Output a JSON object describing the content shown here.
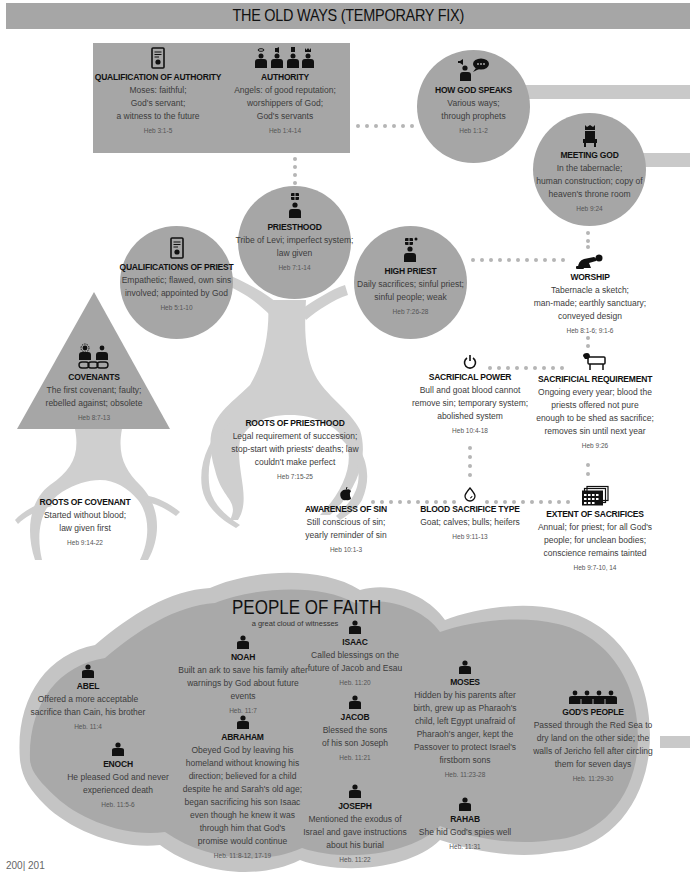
{
  "banner": {
    "title": "THE OLD WAYS (TEMPORARY FIX)"
  },
  "colors": {
    "node_fill": "#a6a6a6",
    "band_fill": "#c9c9c9",
    "tree_fill": "#cfcfcf",
    "dot": "#b5b5b5",
    "text": "#111111"
  },
  "old_ways": {
    "qualification_of_authority": {
      "title": "QUALIFICATION OF AUTHORITY",
      "lines": [
        "Moses: faithful;",
        "God's servant;",
        "a witness to the future"
      ],
      "ref": "Heb 3:1-5",
      "icon": "certificate-icon"
    },
    "authority": {
      "title": "AUTHORITY",
      "lines": [
        "Angels: of good reputation;",
        "worshippers of God;",
        "God's servants"
      ],
      "ref": "Heb 1:4-14",
      "icon": "four-persons-icon"
    },
    "how_god_speaks": {
      "title": "HOW GOD SPEAKS",
      "lines": [
        "Various ways;",
        "through prophets"
      ],
      "ref": "Heb 1:1-2",
      "icon": "speaking-person-icon"
    },
    "meeting_god": {
      "title": "MEETING GOD",
      "lines": [
        "In the tabernacle;",
        "human construction; copy of",
        "heaven's throne room"
      ],
      "ref": "Heb 9:24",
      "icon": "throne-icon"
    },
    "priesthood": {
      "title": "PRIESTHOOD",
      "lines": [
        "Tribe of Levi; imperfect system;",
        "law given"
      ],
      "ref": "Heb 7:1-14",
      "icon": "priest-icon"
    },
    "qualifications_of_priest": {
      "title": "QUALIFICATIONS OF PRIEST",
      "lines": [
        "Empathetic; flawed, own sins",
        "involved; appointed by God"
      ],
      "ref": "Heb 5:1-10",
      "icon": "certificate-icon"
    },
    "high_priest": {
      "title": "HIGH PRIEST",
      "lines": [
        "Daily sacrifices; sinful priest;",
        "sinful people; weak"
      ],
      "ref": "Heb 7:26-28",
      "icon": "high-priest-icon"
    },
    "worship": {
      "title": "WORSHIP",
      "lines": [
        "Tabernacle a sketch;",
        "man-made; earthly sanctuary;",
        "conveyed design"
      ],
      "ref": "Heb 8:1-6; 9:1-6",
      "icon": "kneeling-person-icon"
    },
    "covenants": {
      "title": "COVENANTS",
      "lines": [
        "The first covenant; faulty;",
        "rebelled against; obsolete"
      ],
      "ref": "Heb 8:7-13",
      "icon": "covenant-chain-icon"
    },
    "sacrificial_power": {
      "title": "SACRIFICAL POWER",
      "lines": [
        "Bull and goat blood cannot",
        "remove sin; temporary system;",
        "abolished system"
      ],
      "ref": "Heb 10:4-18",
      "icon": "power-icon"
    },
    "sacrificial_requirement": {
      "title": "SACRIFICIAL REQUIREMENT",
      "lines": [
        "Ongoing every year; blood the",
        "priests offered not pure",
        "enough to be shed as sacrifice;",
        "removes sin until next year"
      ],
      "ref": "Heb 9:26",
      "icon": "lamb-icon"
    },
    "roots_of_priesthood": {
      "title": "ROOTS OF PRIESTHOOD",
      "lines": [
        "Legal requirement of succession;",
        "stop-start with priests' deaths; law",
        "couldn't make perfect"
      ],
      "ref": "Heb 7:15-25"
    },
    "roots_of_covenant": {
      "title": "ROOTS OF COVENANT",
      "lines": [
        "Started without blood;",
        "law given first"
      ],
      "ref": "Heb 9:14-22"
    },
    "awareness_of_sin": {
      "title": "AWARENESS OF SIN",
      "lines": [
        "Still conscious of sin;",
        "yearly reminder of sin"
      ],
      "ref": "Heb 10:1-3",
      "icon": "bitten-apple-icon"
    },
    "blood_sacrifice_type": {
      "title": "BLOOD SACRIFICE TYPE",
      "lines": [
        "Goat; calves; bulls; heifers"
      ],
      "ref": "Heb 9:11-13",
      "icon": "blood-drop-icon"
    },
    "extent_of_sacrifices": {
      "title": "EXTENT OF SACRIFICES",
      "lines": [
        "Annual; for priest; for all God's",
        "people; for unclean bodies;",
        "conscience remains tainted"
      ],
      "ref": "Heb 9:7-10, 14",
      "icon": "calendar-stack-icon"
    }
  },
  "people_of_faith": {
    "title": "PEOPLE OF FAITH",
    "subtitle": "a great cloud of witnesses",
    "people": [
      {
        "name": "ABEL",
        "lines": [
          "Offered a more acceptable",
          "sacrifice than Cain, his brother"
        ],
        "ref": "Heb. 11:4"
      },
      {
        "name": "ENOCH",
        "lines": [
          "He pleased God and never",
          "experienced death"
        ],
        "ref": "Heb. 11:5-6"
      },
      {
        "name": "NOAH",
        "lines": [
          "Built an ark to save his family after",
          "warnings by God about future events"
        ],
        "ref": "Heb. 11:7"
      },
      {
        "name": "ABRAHAM",
        "lines": [
          "Obeyed God by leaving his",
          "homeland without knowing his",
          "direction; believed for a child",
          "despite he and Sarah's old age;",
          "began sacrificing his son Isaac",
          "even though he knew it was",
          "through him that God's",
          "promise would continue"
        ],
        "ref": "Heb. 11:8-12, 17-19"
      },
      {
        "name": "ISAAC",
        "lines": [
          "Called blessings on the",
          "future of Jacob and Esau"
        ],
        "ref": "Heb. 11:20"
      },
      {
        "name": "JACOB",
        "lines": [
          "Blessed the sons",
          "of his son Joseph"
        ],
        "ref": "Heb. 11:21"
      },
      {
        "name": "JOSEPH",
        "lines": [
          "Mentioned the exodus of",
          "Israel and gave instructions",
          "about his burial"
        ],
        "ref": "Heb. 11:22"
      },
      {
        "name": "MOSES",
        "lines": [
          "Hidden by his parents after",
          "birth, grew up as Pharaoh's",
          "child, left Egypt unafraid of",
          "Pharaoh's anger, kept the",
          "Passover to protect Israel's",
          "firstborn sons"
        ],
        "ref": "Heb. 11:23-28"
      },
      {
        "name": "RAHAB",
        "lines": [
          "She hid God's spies well"
        ],
        "ref": "Heb. 11:31"
      },
      {
        "name": "GOD'S PEOPLE",
        "lines": [
          "Passed through the Red Sea to",
          "dry land on the other side; the",
          "walls of Jericho fell after circling",
          "them for seven days"
        ],
        "ref": "Heb. 11:29-30"
      }
    ]
  },
  "footer": {
    "page_numbers": "200| 201"
  }
}
